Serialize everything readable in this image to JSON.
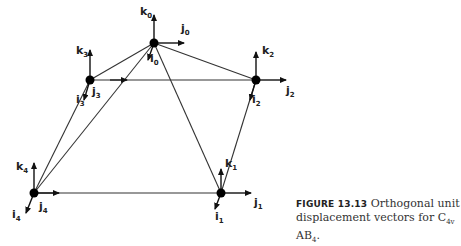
{
  "figure": {
    "nodes": [
      {
        "id": "0",
        "i_label": "i",
        "j_label": "j",
        "k_label": "k",
        "index": "0"
      },
      {
        "id": "1",
        "i_label": "i",
        "j_label": "j",
        "k_label": "k",
        "index": "1"
      },
      {
        "id": "2",
        "i_label": "i",
        "j_label": "j",
        "k_label": "k",
        "index": "2"
      },
      {
        "id": "3",
        "i_label": "i",
        "j_label": "j",
        "k_label": "k",
        "index": "3"
      },
      {
        "id": "4",
        "i_label": "i",
        "j_label": "j",
        "k_label": "k",
        "index": "4"
      }
    ],
    "edges": [
      [
        "0",
        "3"
      ],
      [
        "0",
        "2"
      ],
      [
        "0",
        "4"
      ],
      [
        "0",
        "1"
      ],
      [
        "3",
        "2"
      ],
      [
        "3",
        "4"
      ],
      [
        "2",
        "1"
      ],
      [
        "4",
        "1"
      ]
    ]
  },
  "caption": {
    "figure_number": "FIGURE 13.13",
    "text_line1": "Orthogonal unit",
    "text_line2_prefix": "displacement vectors for C",
    "c_subscript": "4v",
    "middle": " AB",
    "ab_subscript": "4",
    "suffix": "."
  }
}
